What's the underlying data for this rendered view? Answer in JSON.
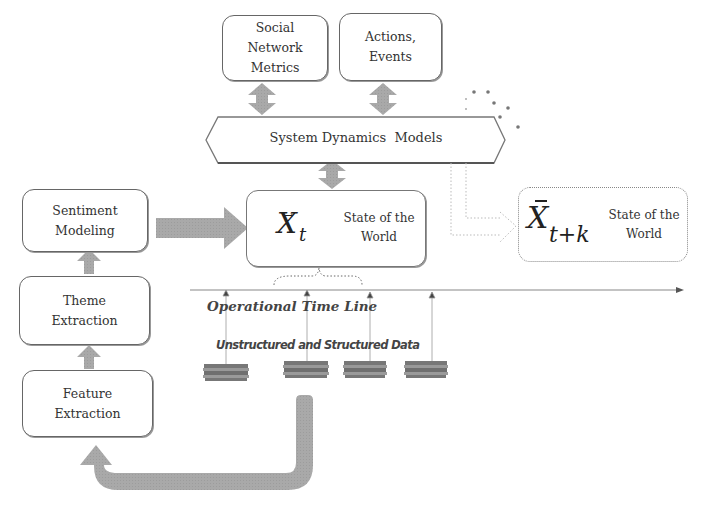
{
  "diagram": {
    "top_boxes": [
      {
        "lines": [
          "Social",
          "Network",
          "Metrics"
        ]
      },
      {
        "lines": [
          "Actions,",
          "Events"
        ]
      }
    ],
    "system_dynamics": {
      "label": "System Dynamics  Models"
    },
    "pipeline": [
      {
        "lines": [
          "Sentiment",
          "Modeling"
        ]
      },
      {
        "lines": [
          "Theme",
          "Extraction"
        ]
      },
      {
        "lines": [
          "Feature",
          "Extraction"
        ]
      }
    ],
    "current_state": {
      "symbol": "X",
      "subscript": "t",
      "label_line1": "State of the",
      "label_line2": "World"
    },
    "future_state": {
      "symbol": "X",
      "subscript": "t+k",
      "label_line1": "State of the",
      "label_line2": "World"
    },
    "timeline": {
      "label": "Operational Time Line"
    },
    "data_sources": {
      "label": "Unstructured and Structured Data",
      "count": 4
    },
    "colors": {
      "arrow_fill": "#a8a8a8",
      "box_border": "#666666",
      "dotted": "#999999"
    }
  }
}
